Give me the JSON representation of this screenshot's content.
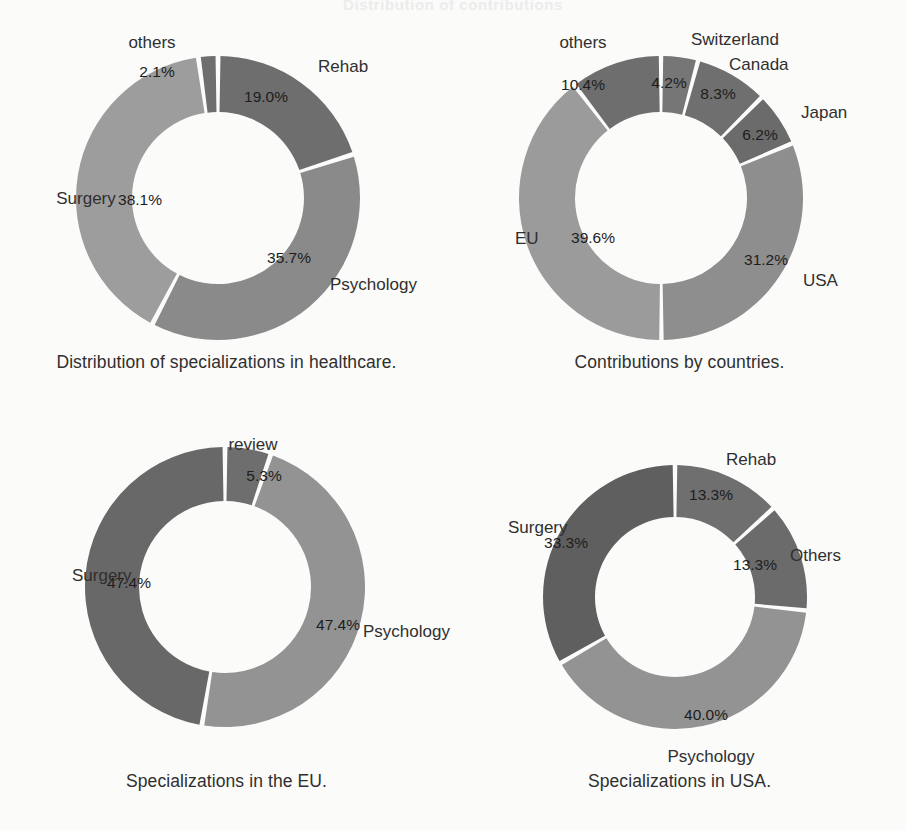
{
  "page": {
    "ghost_top_text": "Distribution of contributions",
    "ghost_mid_left": "",
    "background": "#fbfbfa"
  },
  "palette": {
    "dark": "#6e6e6e",
    "mid": "#7f7f7f",
    "light": "#949494",
    "lighter": "#9d9d9d",
    "very_dark": "#636363",
    "label_color": "#2f2f2f",
    "pct_color": "#1d1d1d",
    "gap_color": "#fbfbfa"
  },
  "chart_data": [
    {
      "id": "healthcare",
      "type": "pie",
      "title": "Distribution of specializations in healthcare.",
      "caption": "Distribution of specializations in healthcare.",
      "donut": true,
      "start_angle_deg": 0,
      "categories": [
        "Rehab",
        "Psychology",
        "Surgery",
        "others"
      ],
      "values": [
        19.0,
        35.7,
        38.1,
        2.1
      ],
      "value_labels": [
        "19.0%",
        "35.7%",
        "38.1%",
        "2.1%"
      ],
      "colors": [
        "#6e6e6e",
        "#8a8a8a",
        "#9d9d9d",
        "#6e6e6e"
      ],
      "legend_position": "outside-labels",
      "grid": false,
      "xlabel": "",
      "ylabel": ""
    },
    {
      "id": "countries",
      "type": "pie",
      "title": "Contributions by countries.",
      "caption": "Contributions by countries.",
      "donut": true,
      "start_angle_deg": 0,
      "categories": [
        "Switzerland",
        "Canada",
        "Japan",
        "USA",
        "EU",
        "others"
      ],
      "values": [
        4.2,
        8.3,
        6.2,
        31.2,
        39.6,
        10.4
      ],
      "value_labels": [
        "4.2%",
        "8.3%",
        "6.2%",
        "31.2%",
        "39.6%",
        "10.4%"
      ],
      "colors": [
        "#767676",
        "#6f6f6f",
        "#6b6b6b",
        "#8e8e8e",
        "#9b9b9b",
        "#6e6e6e"
      ],
      "legend_position": "outside-labels",
      "grid": false,
      "xlabel": "",
      "ylabel": ""
    },
    {
      "id": "eu",
      "type": "pie",
      "title": "Specializations in the EU.",
      "caption": "Specializations in the EU.",
      "donut": true,
      "start_angle_deg": 0,
      "categories": [
        "review",
        "Psychology",
        "Surgery"
      ],
      "values": [
        5.3,
        47.4,
        47.4
      ],
      "value_labels": [
        "5.3%",
        "47.4%",
        "47.4%"
      ],
      "colors": [
        "#6e6e6e",
        "#939393",
        "#686868"
      ],
      "legend_position": "outside-labels",
      "grid": false,
      "xlabel": "",
      "ylabel": ""
    },
    {
      "id": "usa",
      "type": "pie",
      "title": "Specializations in USA.",
      "caption": "Specializations in USA.",
      "donut": true,
      "start_angle_deg": 0,
      "categories": [
        "Rehab",
        "Others",
        "Psychology",
        "Surgery"
      ],
      "values": [
        13.3,
        13.3,
        40.0,
        33.3
      ],
      "value_labels": [
        "13.3%",
        "13.3%",
        "40.0%",
        "33.3%"
      ],
      "colors": [
        "#6f6f6f",
        "#6b6b6b",
        "#939393",
        "#5f5f5f"
      ],
      "legend_position": "outside-labels",
      "grid": false,
      "xlabel": "",
      "ylabel": ""
    }
  ],
  "labels": {
    "healthcare": [
      {
        "name": "others",
        "x": 152,
        "y": 48,
        "anchor": "middle"
      },
      {
        "name": "Rehab",
        "x": 318,
        "y": 72,
        "anchor": "start"
      },
      {
        "name": "Psychology",
        "x": 330,
        "y": 290,
        "anchor": "start"
      },
      {
        "name": "Surgery",
        "x": 86,
        "y": 204,
        "anchor": "middle"
      }
    ],
    "countries": [
      {
        "name": "others",
        "x": 130,
        "y": 48,
        "anchor": "middle"
      },
      {
        "name": "Switzerland",
        "x": 238,
        "y": 45,
        "anchor": "start"
      },
      {
        "name": "Canada",
        "x": 276,
        "y": 70,
        "anchor": "start"
      },
      {
        "name": "Japan",
        "x": 348,
        "y": 118,
        "anchor": "start"
      },
      {
        "name": "USA",
        "x": 350,
        "y": 286,
        "anchor": "start"
      },
      {
        "name": "EU",
        "x": 62,
        "y": 244,
        "anchor": "start"
      }
    ],
    "eu": [
      {
        "name": "review",
        "x": 253,
        "y": 35,
        "anchor": "middle"
      },
      {
        "name": "Surgery",
        "x": 72,
        "y": 166,
        "anchor": "start"
      },
      {
        "name": "Psychology",
        "x": 363,
        "y": 222,
        "anchor": "start"
      }
    ],
    "usa": [
      {
        "name": "Rehab",
        "x": 273,
        "y": 50,
        "anchor": "start"
      },
      {
        "name": "Others",
        "x": 337,
        "y": 146,
        "anchor": "start"
      },
      {
        "name": "Psychology",
        "x": 258,
        "y": 347,
        "anchor": "middle"
      },
      {
        "name": "Surgery",
        "x": 55,
        "y": 118,
        "anchor": "start"
      }
    ]
  },
  "pct_labels": {
    "healthcare": [
      {
        "text": "2.1%",
        "x": 157,
        "y": 77
      },
      {
        "text": "19.0%",
        "x": 266,
        "y": 102
      },
      {
        "text": "35.7%",
        "x": 289,
        "y": 263
      },
      {
        "text": "38.1%",
        "x": 140,
        "y": 205
      }
    ],
    "countries": [
      {
        "text": "10.4%",
        "x": 130,
        "y": 90
      },
      {
        "text": "4.2%",
        "x": 216,
        "y": 88
      },
      {
        "text": "8.3%",
        "x": 265,
        "y": 99
      },
      {
        "text": "6.2%",
        "x": 307,
        "y": 140
      },
      {
        "text": "31.2%",
        "x": 313,
        "y": 265
      },
      {
        "text": "39.6%",
        "x": 140,
        "y": 243
      }
    ],
    "eu": [
      {
        "text": "5.3%",
        "x": 264,
        "y": 66
      },
      {
        "text": "47.4%",
        "x": 129,
        "y": 173
      },
      {
        "text": "47.4%",
        "x": 338,
        "y": 215
      }
    ],
    "usa": [
      {
        "text": "13.3%",
        "x": 258,
        "y": 85
      },
      {
        "text": "13.3%",
        "x": 302,
        "y": 155
      },
      {
        "text": "40.0%",
        "x": 253,
        "y": 305
      },
      {
        "text": "33.3%",
        "x": 113,
        "y": 133
      }
    ]
  },
  "geometry": {
    "healthcare": {
      "cx": 218,
      "cy": 198,
      "r_outer": 142,
      "r_inner": 86,
      "gap_deg": 2.0
    },
    "countries": {
      "cx": 208,
      "cy": 198,
      "r_outer": 142,
      "r_inner": 86,
      "gap_deg": 1.8
    },
    "eu": {
      "cx": 225,
      "cy": 172,
      "r_outer": 140,
      "r_inner": 86,
      "gap_deg": 2.0
    },
    "usa": {
      "cx": 222,
      "cy": 182,
      "r_outer": 132,
      "r_inner": 80,
      "gap_deg": 2.0
    }
  }
}
